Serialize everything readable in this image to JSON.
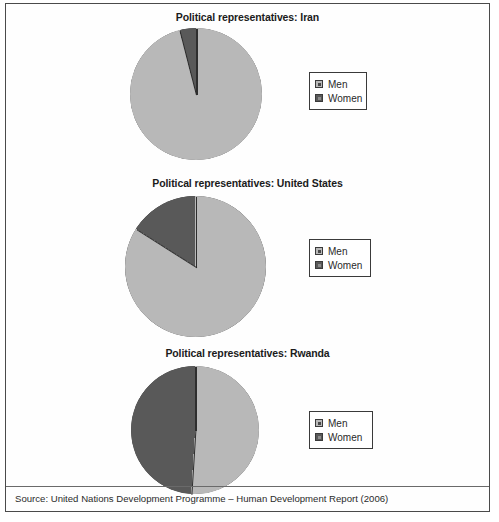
{
  "figure": {
    "source_note": "Source: United Nations Development Programme – Human Development Report (2006)",
    "colors": {
      "men": "#b8b8b8",
      "women": "#595959",
      "outline": "#2e2e2e",
      "frame": "#4a4a4a",
      "text": "#1b1b1b"
    }
  },
  "legend": {
    "men_label": "Men",
    "women_label": "Women"
  },
  "chart_data": [
    {
      "type": "pie",
      "title": "Political representatives: Iran",
      "categories": [
        "Men",
        "Women"
      ],
      "values": [
        96,
        4
      ],
      "unit": "percent",
      "colors": [
        "#b8b8b8",
        "#595959"
      ],
      "legend_position": "right",
      "start_angle_deg": 0,
      "direction": "counterclockwise"
    },
    {
      "type": "pie",
      "title": "Political representatives: United States",
      "categories": [
        "Men",
        "Women"
      ],
      "values": [
        84,
        16
      ],
      "unit": "percent",
      "colors": [
        "#b8b8b8",
        "#595959"
      ],
      "legend_position": "right",
      "start_angle_deg": 0,
      "direction": "counterclockwise"
    },
    {
      "type": "pie",
      "title": "Political representatives: Rwanda",
      "categories": [
        "Men",
        "Women"
      ],
      "values": [
        51,
        49
      ],
      "unit": "percent",
      "colors": [
        "#b8b8b8",
        "#595959"
      ],
      "legend_position": "right",
      "start_angle_deg": 0,
      "direction": "counterclockwise"
    }
  ]
}
